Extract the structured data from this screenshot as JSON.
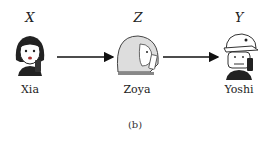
{
  "nodes": [
    {
      "variable": "X",
      "name": "Xia"
    },
    {
      "variable": "Z",
      "name": "Zoya"
    },
    {
      "variable": "Y",
      "name": "Yoshi"
    }
  ],
  "edges": [
    {
      "from": "X",
      "to": "Z"
    },
    {
      "from": "Z",
      "to": "Y"
    }
  ],
  "caption": "(b)"
}
